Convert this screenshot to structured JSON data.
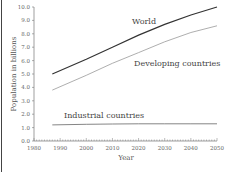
{
  "chart_data": {
    "type": "line",
    "title": "",
    "xlabel": "Year",
    "ylabel": "Population in billions",
    "xlim": [
      1980,
      2050
    ],
    "ylim": [
      0,
      10
    ],
    "xticks": [
      "1980",
      "1990",
      "2000",
      "2010",
      "2020",
      "2030",
      "2040",
      "2050"
    ],
    "yticks": [
      "0.0",
      "1.0",
      "2.0",
      "3.0",
      "4.0",
      "5.0",
      "6.0",
      "7.0",
      "8.0",
      "9.0",
      "10.0"
    ],
    "grid": false,
    "legend": "inline labels",
    "x": [
      1987,
      2000,
      2010,
      2020,
      2030,
      2040,
      2050
    ],
    "series": [
      {
        "name": "World",
        "values": [
          5.0,
          6.1,
          7.0,
          7.9,
          8.7,
          9.4,
          10.0
        ]
      },
      {
        "name": "Developing countries",
        "values": [
          3.8,
          4.9,
          5.8,
          6.6,
          7.4,
          8.1,
          8.6
        ]
      },
      {
        "name": "Industrial countries",
        "values": [
          1.2,
          1.25,
          1.27,
          1.28,
          1.28,
          1.28,
          1.28
        ]
      }
    ],
    "annotations": [
      "World",
      "Developing countries",
      "Industrial countries"
    ]
  },
  "labels": {
    "world": "World",
    "developing": "Developing countries",
    "industrial": "Industrial countries",
    "xlabel": "Year",
    "ylabel": "Population in billions"
  }
}
